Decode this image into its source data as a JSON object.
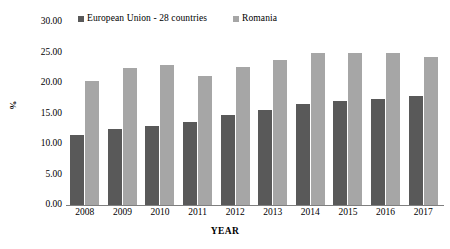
{
  "chart_data": {
    "type": "bar",
    "title": "",
    "xlabel": "YEAR",
    "ylabel": "%",
    "categories": [
      "2008",
      "2009",
      "2010",
      "2011",
      "2012",
      "2013",
      "2014",
      "2015",
      "2016",
      "2017"
    ],
    "series": [
      {
        "name": "European Union - 28 countries",
        "color": "#595959",
        "values": [
          11.5,
          12.5,
          12.9,
          13.6,
          14.8,
          15.5,
          16.5,
          17.0,
          17.4,
          17.8
        ]
      },
      {
        "name": "Romania",
        "color": "#a6a6a6",
        "values": [
          20.4,
          22.4,
          22.9,
          21.1,
          22.6,
          23.7,
          25.0,
          25.0,
          25.0,
          24.2
        ]
      }
    ],
    "ylim": [
      0,
      30
    ],
    "ytick_step": 5,
    "ytick_labels": [
      "30.00",
      "25.00",
      "20.00",
      "15.00",
      "10.00",
      "5.00",
      "0.00"
    ],
    "ytick_values": [
      30,
      25,
      20,
      15,
      10,
      5,
      0
    ],
    "grid": false,
    "legend_position": "top"
  },
  "legend": {
    "entries": [
      {
        "label": "European Union - 28 countries",
        "color": "#595959"
      },
      {
        "label": "Romania",
        "color": "#a6a6a6"
      }
    ]
  }
}
